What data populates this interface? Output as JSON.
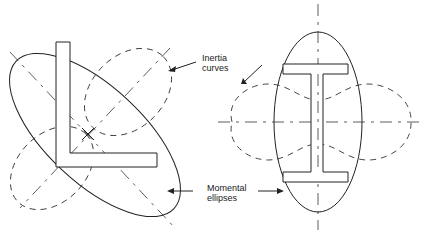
{
  "figure": {
    "labels": {
      "inertia": [
        "Inertia",
        "curves"
      ],
      "momental": [
        "Momental",
        "ellipses"
      ]
    },
    "sections": [
      {
        "name": "angle-section",
        "shape": "L"
      },
      {
        "name": "i-beam-section",
        "shape": "I"
      }
    ],
    "colors": {
      "line": "#222222",
      "background": "#ffffff"
    }
  }
}
